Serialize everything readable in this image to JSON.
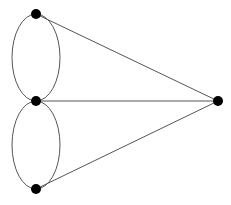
{
  "diagram": {
    "type": "graph",
    "canvas": {
      "width": 231,
      "height": 205,
      "background": "#ffffff"
    },
    "style": {
      "edge_color": "#555555",
      "edge_width": 1,
      "node_color": "#000000",
      "node_radius": 5
    },
    "nodes": [
      {
        "id": "top",
        "x": 36,
        "y": 14
      },
      {
        "id": "middle",
        "x": 36,
        "y": 101
      },
      {
        "id": "bottom",
        "x": 36,
        "y": 189
      },
      {
        "id": "right",
        "x": 218,
        "y": 101
      }
    ],
    "curved_edges": [
      {
        "id": "upper-loop",
        "between": [
          "top",
          "middle"
        ],
        "cx": 36,
        "cy": 57.5,
        "rx": 24,
        "ry": 43.5
      },
      {
        "id": "lower-loop",
        "between": [
          "middle",
          "bottom"
        ],
        "cx": 36,
        "cy": 145,
        "rx": 24,
        "ry": 44
      }
    ],
    "straight_edges": [
      {
        "id": "top-right",
        "from": "top",
        "to": "right"
      },
      {
        "id": "middle-right",
        "from": "middle",
        "to": "right"
      },
      {
        "id": "bottom-right",
        "from": "bottom",
        "to": "right"
      }
    ]
  }
}
